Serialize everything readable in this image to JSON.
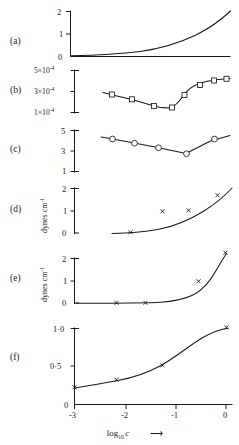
{
  "figure": {
    "xaxis": {
      "label_main": "log",
      "label_sub": "10",
      "label_var": "c",
      "arrow": "⟶",
      "ticks": [
        "-3",
        "-2",
        "-1",
        "0"
      ],
      "tick_values": [
        -3,
        -2,
        -1,
        0
      ],
      "range": [
        -3.0,
        0.2
      ]
    },
    "panels": [
      {
        "id": "a",
        "letter": "(a)",
        "ylabel": "",
        "yticks": [
          "2",
          "1",
          "0"
        ],
        "ytick_values": [
          2,
          1,
          0
        ],
        "ylim": [
          0,
          2.15
        ],
        "marker": "none",
        "x": [
          -3.0,
          -2.6,
          -2.2,
          -1.8,
          -1.4,
          -1.0,
          -0.6,
          -0.3,
          0.0,
          0.15
        ],
        "y": [
          0.02,
          0.035,
          0.06,
          0.1,
          0.17,
          0.3,
          0.55,
          0.85,
          1.4,
          2.0
        ]
      },
      {
        "id": "b",
        "letter": "(b)",
        "ylabel": "",
        "yticks": [
          "5×10",
          "3×10",
          "1×10"
        ],
        "ytick_exp": "-4",
        "ytick_values": [
          0.0005,
          0.0003,
          0.0001
        ],
        "ylim": [
          5e-05,
          0.00056
        ],
        "marker": "square",
        "x": [
          -2.35,
          -2.05,
          -1.65,
          -1.2,
          -0.8,
          -0.55,
          -0.28,
          -0.05,
          0.12
        ],
        "y": [
          0.000295,
          0.000265,
          0.000215,
          0.000145,
          0.000135,
          0.000255,
          0.000355,
          0.000415,
          0.000435
        ]
      },
      {
        "id": "c",
        "letter": "(c)",
        "ylabel": "",
        "yticks": [
          "5",
          "3",
          "1"
        ],
        "ytick_values": [
          5,
          3,
          1
        ],
        "ylim": [
          0.6,
          5.4
        ],
        "marker": "circle",
        "x": [
          -2.4,
          -2.05,
          -1.6,
          -1.1,
          -0.55,
          -0.12,
          0.12
        ],
        "y": [
          4.35,
          4.1,
          3.65,
          3.25,
          2.65,
          3.85,
          4.4
        ]
      },
      {
        "id": "d",
        "letter": "(d)",
        "ylabel": "dynes cm",
        "ylabel_exp": "-1",
        "yticks": [
          "2",
          "1",
          "0"
        ],
        "ytick_values": [
          2,
          1,
          0
        ],
        "ylim": [
          -0.12,
          2.15
        ],
        "marker": "cross",
        "x": [
          -2.1,
          -1.55,
          -1.05,
          -0.62,
          -0.2,
          0.05
        ],
        "y": [
          0.02,
          0.06,
          0.92,
          0.5,
          1.05,
          1.62
        ]
      },
      {
        "id": "e",
        "letter": "(e)",
        "ylabel": "dynes cm",
        "ylabel_exp": "-1",
        "yticks": [
          "2",
          "1",
          "0"
        ],
        "ytick_values": [
          2,
          1,
          0
        ],
        "ylim": [
          -0.12,
          2.4
        ],
        "marker": "cross",
        "x": [
          -2.45,
          -2.0,
          -1.55,
          -1.05,
          -0.5,
          -0.15,
          0.1
        ],
        "y": [
          0.01,
          0.01,
          0.02,
          0.04,
          0.12,
          0.85,
          2.25
        ]
      },
      {
        "id": "f",
        "letter": "(f)",
        "ylabel": "",
        "yticks": [
          "1·0",
          "0·5"
        ],
        "ytick_values": [
          1.0,
          0.5
        ],
        "ylim": [
          0,
          1.12
        ],
        "marker": "cross",
        "x": [
          -3.0,
          -2.1,
          -1.05,
          -0.35,
          0.1
        ],
        "y": [
          0.22,
          0.3,
          0.5,
          0.82,
          1.0
        ]
      }
    ]
  }
}
